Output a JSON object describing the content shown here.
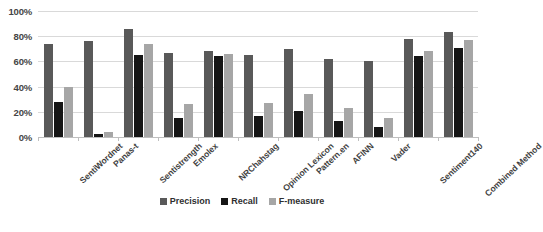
{
  "chart_data": {
    "type": "bar",
    "title": "",
    "xlabel": "",
    "ylabel": "",
    "ylim": [
      0,
      100
    ],
    "grid": true,
    "legend_position": "bottom",
    "y_ticks": [
      "0%",
      "20%",
      "40%",
      "60%",
      "80%",
      "100%"
    ],
    "categories": [
      "SentiWordnet",
      "Panas-t",
      "Sentistrength",
      "Emolex",
      "NRChahstag",
      "Opinion Lexicon",
      "Pattern.en",
      "AFINN",
      "Vader",
      "Sentiment140",
      "Combined Method"
    ],
    "series": [
      {
        "name": "Precision",
        "color": "#595959",
        "values": [
          74,
          76,
          86,
          67,
          68,
          65,
          70,
          62,
          60,
          78,
          83
        ]
      },
      {
        "name": "Recall",
        "color": "#151515",
        "values": [
          28,
          2,
          65,
          15,
          64,
          17,
          21,
          13,
          8,
          64,
          71
        ]
      },
      {
        "name": "F-measure",
        "color": "#a6a6a6",
        "values": [
          40,
          4,
          74,
          26,
          66,
          27,
          34,
          23,
          15,
          68,
          77
        ]
      }
    ]
  }
}
